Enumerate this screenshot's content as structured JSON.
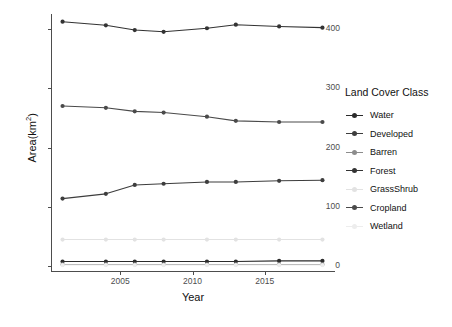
{
  "chart_data": {
    "type": "line",
    "title": "",
    "xlabel": "Year",
    "ylabel": "Area(km2)",
    "ylabel_display": "Area(km",
    "ylabel_exponent": "2",
    "ylabel_suffix": ")",
    "xlim": [
      2000.2,
      2019.8
    ],
    "ylim": [
      -8,
      425
    ],
    "grid": false,
    "legend_position": "right",
    "legend_title": "Land Cover Class",
    "x": [
      2001,
      2004,
      2006,
      2008,
      2011,
      2013,
      2016,
      2019
    ],
    "xticks": [
      2005,
      2010,
      2015
    ],
    "xtick_labels": [
      "2005",
      "2010",
      "2015"
    ],
    "yticks": [
      0,
      100,
      200,
      300,
      400
    ],
    "ytick_labels": [
      "0",
      "100",
      "200",
      "300",
      "400"
    ],
    "series": [
      {
        "name": "Water",
        "color": "#2b2b2b",
        "values": [
          8,
          8,
          8,
          8,
          8,
          8,
          9,
          9
        ]
      },
      {
        "name": "Developed",
        "color": "#3d3d3d",
        "values": [
          114,
          122,
          137,
          139,
          142,
          142,
          144,
          145
        ]
      },
      {
        "name": "Barren",
        "color": "#8c8c8c",
        "values": [
          3,
          3,
          3,
          3,
          3,
          3,
          3,
          3
        ]
      },
      {
        "name": "Forest",
        "color": "#333333",
        "values": [
          412,
          406,
          398,
          395,
          401,
          407,
          404,
          402
        ]
      },
      {
        "name": "GrassShrub",
        "color": "#e2e2e2",
        "values": [
          45,
          45,
          45,
          45,
          45,
          45,
          45,
          45
        ]
      },
      {
        "name": "Cropland",
        "color": "#4a4a4a",
        "values": [
          270,
          267,
          261,
          259,
          252,
          245,
          243,
          243
        ]
      },
      {
        "name": "Wetland",
        "color": "#ededed",
        "values": [
          2,
          2,
          2,
          2,
          2,
          2,
          2,
          2
        ]
      }
    ]
  }
}
